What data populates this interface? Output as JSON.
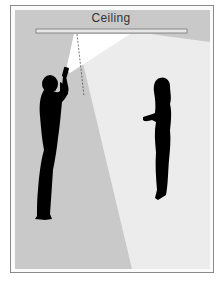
{
  "diagram": {
    "ceiling_label": "Ceiling",
    "elements": [
      {
        "name": "ceiling-bar",
        "kind": "surface"
      },
      {
        "name": "flashlight-beam",
        "kind": "light-cone"
      },
      {
        "name": "reflected-light-area",
        "kind": "illuminated-region"
      },
      {
        "name": "man-silhouette",
        "kind": "figure",
        "holding": "flashlight"
      },
      {
        "name": "woman-silhouette",
        "kind": "figure"
      }
    ],
    "colors": {
      "background_grey": "#c9c9c9",
      "lit_area": "#ececec",
      "beam": "#ffffff",
      "silhouette": "#000000",
      "ceiling_bar": "#e6e6e6",
      "border": "#8a8a8a"
    }
  }
}
